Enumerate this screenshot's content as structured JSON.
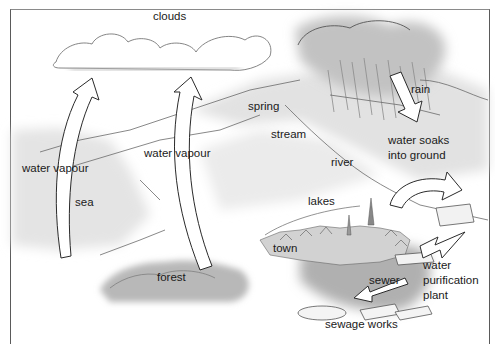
{
  "diagram": {
    "labels": {
      "clouds": "clouds",
      "rain": "rain",
      "spring": "spring",
      "stream": "stream",
      "river": "river",
      "water_soaks": "water soaks\ninto ground",
      "water_vapour_sea": "water vapour",
      "water_vapour_forest": "water vapour",
      "sea": "sea",
      "lakes": "lakes",
      "town": "town",
      "forest": "forest",
      "sewer": "sewer",
      "water_purification_plant": "water\npurification\nplant",
      "sewage_works": "sewage works"
    },
    "arrows": [
      {
        "name": "evaporation-from-sea",
        "direction": "up",
        "label": "water vapour"
      },
      {
        "name": "transpiration-from-forest",
        "direction": "up",
        "label": "water vapour"
      },
      {
        "name": "rainfall",
        "direction": "down",
        "label": "rain"
      },
      {
        "name": "ground-to-plant",
        "direction": "curved-right",
        "label": ""
      },
      {
        "name": "plant-to-town",
        "direction": "down-left",
        "label": ""
      },
      {
        "name": "sewer-to-works",
        "direction": "down-left",
        "label": "sewer"
      }
    ],
    "colors": {
      "line": "#3a3a3a",
      "wash": "#d9d9d9",
      "dark_wash": "#a8a8a8",
      "background": "#ffffff"
    }
  }
}
